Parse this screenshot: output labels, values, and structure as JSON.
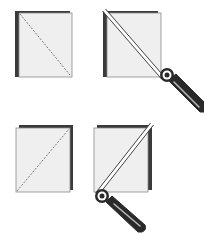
{
  "figure": {
    "colors": {
      "fabric_face": "#efefef",
      "fabric_edge": "#3a3a3a",
      "outline": "#8a8a8a",
      "dash_line": "#777777",
      "cutter_dark": "#2a2a2a",
      "cutter_light": "#ffffff"
    },
    "panels": [
      {
        "id": "top-left",
        "step": "mark diagonal",
        "diagonal": "top-left to bottom-right",
        "style": "dashed"
      },
      {
        "id": "top-right",
        "step": "cut diagonal",
        "diagonal": "top-left to bottom-right",
        "tool": "rotary-cutter"
      },
      {
        "id": "bottom-left",
        "step": "mark diagonal",
        "diagonal": "bottom-left to top-right",
        "style": "dashed"
      },
      {
        "id": "bottom-right",
        "step": "cut diagonal",
        "diagonal": "bottom-left to top-right",
        "tool": "rotary-cutter"
      }
    ]
  }
}
